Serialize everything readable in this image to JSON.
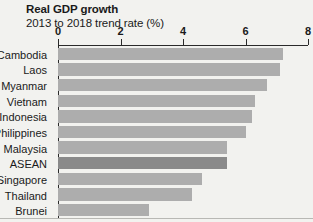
{
  "chart_data": {
    "type": "bar",
    "orientation": "horizontal",
    "title": "Real GDP growth",
    "subtitle": "2013 to 2018 trend rate (%)",
    "xlabel": "",
    "ylabel": "",
    "xlim": [
      0,
      8
    ],
    "xticks": [
      0,
      2,
      4,
      6,
      8
    ],
    "xtick_labels": [
      "0",
      "2",
      "4",
      "6",
      "8"
    ],
    "grid": false,
    "legend": "none",
    "highlight_category": "ASEAN",
    "colors": {
      "bar": "#adadad",
      "bar_highlight": "#8a8a8a",
      "axis": "#2a2a2a",
      "background": "#f2f2ef",
      "text": "#1a1a1a"
    },
    "categories": [
      "Cambodia",
      "Laos",
      "Myanmar",
      "Vietnam",
      "Indonesia",
      "Philippines",
      "Malaysia",
      "ASEAN",
      "Singapore",
      "Thailand",
      "Brunei"
    ],
    "values": [
      7.2,
      7.1,
      6.7,
      6.3,
      6.2,
      6.0,
      5.4,
      5.4,
      4.6,
      4.3,
      2.9
    ],
    "bars": [
      {
        "label": "Cambodia",
        "value": 7.2,
        "highlight": false
      },
      {
        "label": "Laos",
        "value": 7.1,
        "highlight": false
      },
      {
        "label": "Myanmar",
        "value": 6.7,
        "highlight": false
      },
      {
        "label": "Vietnam",
        "value": 6.3,
        "highlight": false
      },
      {
        "label": "Indonesia",
        "value": 6.2,
        "highlight": false
      },
      {
        "label": "Philippines",
        "value": 6.0,
        "highlight": false
      },
      {
        "label": "Malaysia",
        "value": 5.4,
        "highlight": false
      },
      {
        "label": "ASEAN",
        "value": 5.4,
        "highlight": true
      },
      {
        "label": "Singapore",
        "value": 4.6,
        "highlight": false
      },
      {
        "label": "Thailand",
        "value": 4.3,
        "highlight": false
      },
      {
        "label": "Brunei",
        "value": 2.9,
        "highlight": false
      }
    ]
  }
}
